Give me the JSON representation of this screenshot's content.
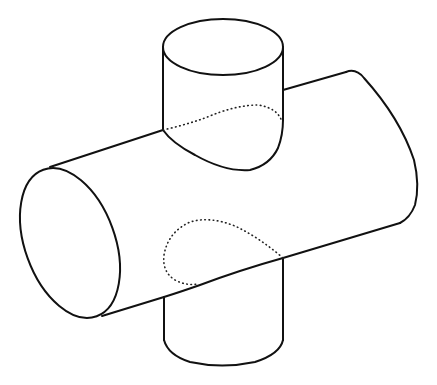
{
  "figure": {
    "stroke_color": "#111111",
    "background_color": "#ffffff",
    "parts": [
      {
        "name": "horizontal-cylinder",
        "style": "solid"
      },
      {
        "name": "vertical-cylinder-top",
        "style": "solid"
      },
      {
        "name": "vertical-cylinder-bottom",
        "style": "solid"
      },
      {
        "name": "hidden-intersection-upper",
        "style": "dotted"
      },
      {
        "name": "hidden-intersection-lower",
        "style": "dotted"
      }
    ]
  }
}
